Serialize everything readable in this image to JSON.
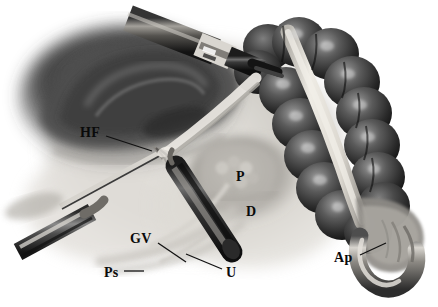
{
  "figure": {
    "name": "laparoscopic-right-colon-illustration",
    "style": "grayscale-medical-airbrush",
    "width": 438,
    "height": 307,
    "background": "#ffffff"
  },
  "labels": [
    {
      "id": "hf",
      "text": "HF",
      "meaning": "hepatic-flexure",
      "x": 80,
      "y": 126,
      "leader": true
    },
    {
      "id": "p",
      "text": "P",
      "meaning": "pancreas",
      "x": 236,
      "y": 170,
      "leader": false
    },
    {
      "id": "d",
      "text": "D",
      "meaning": "duodenum",
      "x": 246,
      "y": 205,
      "leader": false
    },
    {
      "id": "gv",
      "text": "GV",
      "meaning": "gonadal-vessels",
      "x": 130,
      "y": 232,
      "leader": true
    },
    {
      "id": "ps",
      "text": "Ps",
      "meaning": "psoas-muscle",
      "x": 104,
      "y": 266,
      "leader": true
    },
    {
      "id": "u",
      "text": "U",
      "meaning": "ureter",
      "x": 226,
      "y": 266,
      "leader": true
    },
    {
      "id": "ap",
      "text": "Ap",
      "meaning": "appendix",
      "x": 334,
      "y": 251,
      "leader": true
    }
  ],
  "structures": [
    {
      "name": "ascending-colon-haustra",
      "tone": "#2e2e2e"
    },
    {
      "name": "taenia-coli-band",
      "tone": "#e6e4de"
    },
    {
      "name": "appendix",
      "tone": "#8d8d8d"
    },
    {
      "name": "liver-mass",
      "tone": "#4a4a4a"
    },
    {
      "name": "retroperitoneal-fascia",
      "tone": "#cfcdc8"
    },
    {
      "name": "laparoscopic-trocar",
      "tone": "#474747"
    },
    {
      "name": "grasper-instrument",
      "tone": "#3a3a3a"
    },
    {
      "name": "dissector-probe",
      "tone": "#5a5a5a"
    }
  ],
  "colors": {
    "ink": "#0a0a0a",
    "leader_line": "#111111",
    "paper": "#ffffff"
  }
}
